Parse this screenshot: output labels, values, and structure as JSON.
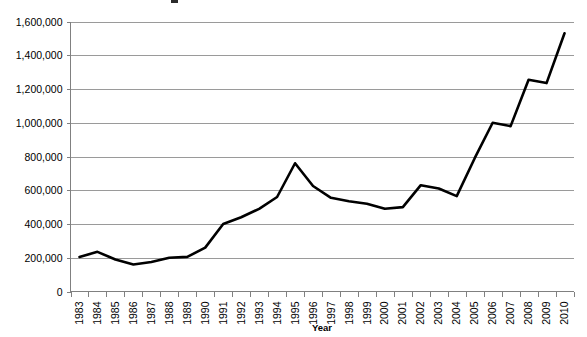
{
  "chart_data": {
    "type": "line",
    "title": "",
    "xlabel": "Year",
    "ylabel": "",
    "grid": true,
    "legend": false,
    "ylim": [
      0,
      1600000
    ],
    "ytick_step": 200000,
    "ytick_labels": [
      "1,600,000",
      "1,400,000",
      "1,200,000",
      "1,000,000",
      "800,000",
      "600,000",
      "400,000",
      "200,000",
      "0"
    ],
    "ytick_values": [
      1600000,
      1400000,
      1200000,
      1000000,
      800000,
      600000,
      400000,
      200000,
      0
    ],
    "categories": [
      "1983",
      "1984",
      "1985",
      "1986",
      "1987",
      "1988",
      "1989",
      "1990",
      "1991",
      "1992",
      "1993",
      "1994",
      "1995",
      "1996",
      "1997",
      "1998",
      "1999",
      "2000",
      "2001",
      "2002",
      "2003",
      "2004",
      "2005",
      "2006",
      "2007",
      "2008",
      "2009",
      "2010"
    ],
    "values": [
      205000,
      235000,
      190000,
      160000,
      175000,
      200000,
      205000,
      260000,
      400000,
      440000,
      490000,
      560000,
      760000,
      625000,
      555000,
      535000,
      520000,
      490000,
      500000,
      630000,
      610000,
      565000,
      790000,
      1000000,
      980000,
      1255000,
      1235000,
      1530000
    ],
    "series_name": "",
    "line_color": "#000000",
    "grid_color": "#9a9a9a",
    "axis_color": "#808080"
  }
}
